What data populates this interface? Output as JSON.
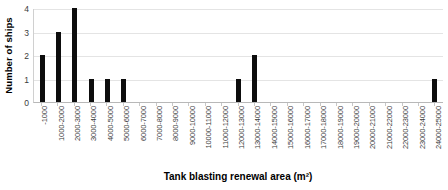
{
  "chart_data": {
    "type": "bar",
    "title": "",
    "xlabel": "Tank blasting renewal area (m²)",
    "ylabel": "Number of ships",
    "categories": [
      "-1000",
      "1000-2000",
      "2000-3000",
      "3000-4000",
      "4000-5000",
      "5000-6000",
      "6000-7000",
      "7000-8000",
      "8000-9000",
      "9000-10000",
      "10000-11000",
      "11000-12000",
      "12000-13000",
      "13000-14000",
      "14000-15000",
      "15000-16000",
      "16000-17000",
      "17000-18000",
      "18000-19000",
      "19000-20000",
      "20000-21000",
      "21000-22000",
      "22000-23000",
      "23000-24000",
      "24000-25000"
    ],
    "values": [
      2,
      3,
      4,
      1,
      1,
      1,
      0,
      0,
      0,
      0,
      0,
      0,
      1,
      2,
      0,
      0,
      0,
      0,
      0,
      0,
      0,
      0,
      0,
      0,
      1
    ],
    "ylim": [
      0,
      4
    ],
    "yticks": [
      "0",
      "1",
      "2",
      "3",
      "4"
    ],
    "grid": true,
    "legend": "none",
    "bar_color": "#0d0d0d",
    "gridline_color": "#e4e4e4"
  }
}
